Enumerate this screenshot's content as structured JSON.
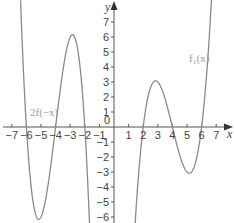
{
  "chart_data": {
    "type": "line",
    "title": "",
    "xlabel": "x",
    "ylabel": "y",
    "xlim": [
      -7,
      7
    ],
    "ylim": [
      -7,
      7
    ],
    "grid": false,
    "origin_label": "0",
    "x_ticks": [
      -7,
      -6,
      -5,
      -4,
      -3,
      -2,
      -1,
      1,
      2,
      3,
      4,
      5,
      6,
      7
    ],
    "x_tick_labels": [
      "−7",
      "−6",
      "−5",
      "−4",
      "−3",
      "−2",
      "−1",
      "1",
      "2",
      "3",
      "4",
      "5",
      "6",
      "7"
    ],
    "y_ticks": [
      7,
      6,
      5,
      4,
      3,
      2,
      1,
      -1,
      -2,
      -3,
      -4,
      -5,
      -6
    ],
    "y_tick_labels": [
      "7",
      "6",
      "5",
      "4",
      "3",
      "2",
      "1",
      "−1",
      "−2",
      "−3",
      "−4",
      "−5",
      "−6"
    ],
    "series": [
      {
        "name": "f1(x)",
        "label": "f₁(x)",
        "formula": "(x-2)(x-4)(x-6)",
        "zeros": [
          2,
          4,
          6
        ],
        "local_max": [
          2.85,
          3.08
        ],
        "local_min": [
          5.15,
          -3.08
        ],
        "x": [
          1.3,
          1.5,
          2,
          2.5,
          2.85,
          3,
          3.5,
          4,
          4.5,
          5,
          5.15,
          5.5,
          6,
          6.5,
          6.7
        ],
        "values": [
          -7.38,
          -5.63,
          0,
          2.19,
          3.08,
          3.0,
          1.88,
          0,
          -1.88,
          -3.0,
          -3.08,
          -2.19,
          0,
          3.38,
          5.19
        ],
        "color": "#8a8a8a"
      },
      {
        "name": "2f(-x)",
        "label": "2f(−x)",
        "formula": "-2(x+2)(x+4)(x+6)",
        "zeros": [
          -6,
          -4,
          -2
        ],
        "local_max": [
          -2.85,
          6.16
        ],
        "local_min": [
          -5.15,
          -6.16
        ],
        "x": [
          -6.4,
          -6,
          -5.5,
          -5.15,
          -5,
          -4.5,
          -4,
          -3.5,
          -3,
          -2.85,
          -2.5,
          -2,
          -1.6
        ],
        "values": [
          6.98,
          0,
          -4.38,
          -6.16,
          -6.0,
          -3.75,
          0,
          3.75,
          6.0,
          6.16,
          4.38,
          0,
          -6.98
        ],
        "color": "#8a8a8a"
      }
    ]
  }
}
